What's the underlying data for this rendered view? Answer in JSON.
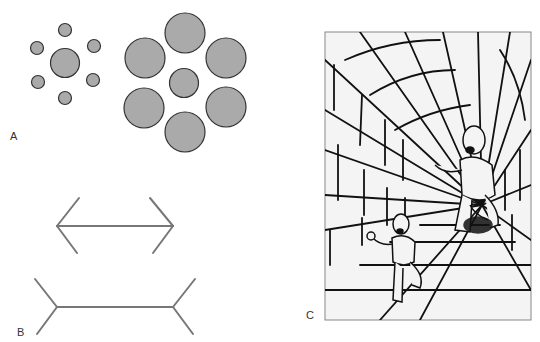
{
  "figure": {
    "panels": [
      {
        "id": "A",
        "label": "A",
        "description": "Ebbinghaus illusion: identical center circles surrounded by small vs. large circles"
      },
      {
        "id": "B",
        "label": "B",
        "description": "Müller-Lyer illusion: equal-length lines with inward vs. outward fins"
      },
      {
        "id": "C",
        "label": "C",
        "description": "Ponzo/corridor illusion: two identical figures in a tiled tunnel appear different sizes"
      }
    ]
  },
  "colors": {
    "circle_fill": "#aaaaaa",
    "circle_stroke": "#333333",
    "line_stroke": "#777777",
    "drawing_stroke": "#111111",
    "frame_bg": "#f4f4f4",
    "frame_border": "#888888"
  }
}
